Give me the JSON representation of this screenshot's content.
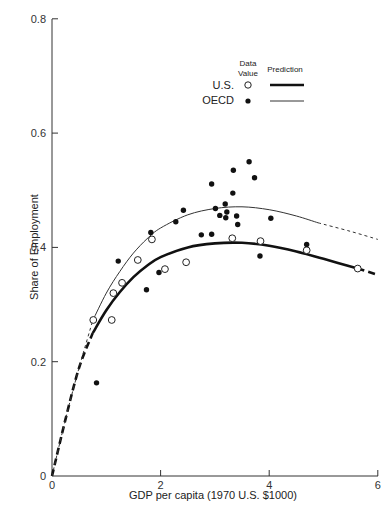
{
  "chart_data": {
    "type": "scatter",
    "title": "",
    "xlabel": "GDP per capita (1970 U.S. $1000)",
    "ylabel": "Share of Employment",
    "xlim": [
      0,
      6
    ],
    "ylim": [
      0,
      0.8
    ],
    "xticks": [
      0,
      2,
      4,
      6
    ],
    "xtick_labels": [
      "0",
      "2",
      "4",
      "6"
    ],
    "yticks": [
      0,
      0.2,
      0.4,
      0.6,
      0.8
    ],
    "ytick_labels": [
      "0",
      "0.2",
      "0.4",
      "0.6",
      "0.8"
    ],
    "grid": false,
    "legend": {
      "position": "upper center-right",
      "col_headers": [
        "Data Value",
        "Prediction"
      ],
      "data_value_header_line1": "Data",
      "data_value_header_line2": "Value",
      "prediction_header": "Prediction",
      "entries": [
        {
          "label": "U.S.",
          "marker": "open-circle",
          "line": "thick"
        },
        {
          "label": "OECD",
          "marker": "filled-circle",
          "line": "thin"
        }
      ]
    },
    "series": [
      {
        "name": "U.S.",
        "kind": "scatter",
        "marker": "open-circle",
        "points": [
          [
            0.76,
            0.273
          ],
          [
            1.1,
            0.273
          ],
          [
            1.13,
            0.32
          ],
          [
            1.29,
            0.338
          ],
          [
            1.58,
            0.378
          ],
          [
            1.84,
            0.414
          ],
          [
            2.08,
            0.362
          ],
          [
            2.47,
            0.374
          ],
          [
            3.32,
            0.416
          ],
          [
            3.84,
            0.411
          ],
          [
            4.69,
            0.395
          ],
          [
            5.63,
            0.363
          ]
        ]
      },
      {
        "name": "OECD",
        "kind": "scatter",
        "marker": "filled-circle",
        "points": [
          [
            0.82,
            0.163
          ],
          [
            1.22,
            0.376
          ],
          [
            1.74,
            0.326
          ],
          [
            1.82,
            0.426
          ],
          [
            1.97,
            0.356
          ],
          [
            2.28,
            0.445
          ],
          [
            2.42,
            0.465
          ],
          [
            2.75,
            0.422
          ],
          [
            2.94,
            0.423
          ],
          [
            2.94,
            0.511
          ],
          [
            3.01,
            0.468
          ],
          [
            3.09,
            0.456
          ],
          [
            3.19,
            0.476
          ],
          [
            3.2,
            0.452
          ],
          [
            3.22,
            0.462
          ],
          [
            3.33,
            0.495
          ],
          [
            3.34,
            0.535
          ],
          [
            3.4,
            0.455
          ],
          [
            3.42,
            0.44
          ],
          [
            3.63,
            0.55
          ],
          [
            3.73,
            0.522
          ],
          [
            3.83,
            0.385
          ],
          [
            4.03,
            0.451
          ],
          [
            4.69,
            0.405
          ]
        ]
      },
      {
        "name": "U.S. Prediction",
        "kind": "line",
        "style": "thick",
        "solid_range": [
          0.75,
          5.63
        ],
        "dashed_ranges": [
          [
            0,
            0.75
          ],
          [
            5.63,
            6.0
          ]
        ],
        "points": [
          [
            0,
            0
          ],
          [
            0.25,
            0.1
          ],
          [
            0.5,
            0.19
          ],
          [
            0.75,
            0.25
          ],
          [
            1.0,
            0.29
          ],
          [
            1.25,
            0.322
          ],
          [
            1.5,
            0.348
          ],
          [
            1.75,
            0.368
          ],
          [
            2.0,
            0.383
          ],
          [
            2.5,
            0.4
          ],
          [
            3.0,
            0.407
          ],
          [
            3.5,
            0.408
          ],
          [
            4.0,
            0.403
          ],
          [
            4.5,
            0.393
          ],
          [
            5.0,
            0.38
          ],
          [
            5.63,
            0.363
          ],
          [
            6.0,
            0.352
          ]
        ]
      },
      {
        "name": "OECD Prediction",
        "kind": "line",
        "style": "thin",
        "solid_range": [
          0.75,
          4.9
        ],
        "dashed_ranges": [
          [
            0,
            0.75
          ],
          [
            4.9,
            6.0
          ]
        ],
        "points": [
          [
            0,
            0
          ],
          [
            0.25,
            0.1
          ],
          [
            0.5,
            0.19
          ],
          [
            0.75,
            0.272
          ],
          [
            1.0,
            0.32
          ],
          [
            1.25,
            0.358
          ],
          [
            1.5,
            0.39
          ],
          [
            1.75,
            0.415
          ],
          [
            2.0,
            0.434
          ],
          [
            2.5,
            0.457
          ],
          [
            3.0,
            0.468
          ],
          [
            3.5,
            0.471
          ],
          [
            4.0,
            0.466
          ],
          [
            4.5,
            0.455
          ],
          [
            4.9,
            0.443
          ],
          [
            5.5,
            0.428
          ],
          [
            6.0,
            0.414
          ]
        ]
      }
    ]
  },
  "caption_fragment": ""
}
